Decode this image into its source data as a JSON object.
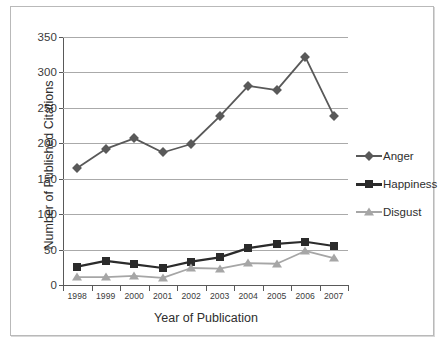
{
  "chart_data": {
    "type": "line",
    "title": "",
    "xlabel": "Year of Publication",
    "ylabel": "Number of Published Citations",
    "categories": [
      "1998",
      "1999",
      "2000",
      "2001",
      "2002",
      "2003",
      "2004",
      "2005",
      "2006",
      "2007"
    ],
    "x": [
      1998,
      1999,
      2000,
      2001,
      2002,
      2003,
      2004,
      2005,
      2006,
      2007
    ],
    "ylim": [
      0,
      350
    ],
    "yticks": [
      0,
      50,
      100,
      150,
      200,
      250,
      300,
      350
    ],
    "ytick_labels": [
      "0",
      "50",
      "100",
      "150",
      "200",
      "250",
      "300",
      "350"
    ],
    "grid": "horizontal",
    "legend_position": "right",
    "series": [
      {
        "name": "Anger",
        "marker": "diamond",
        "color": "#595959",
        "values": [
          165,
          192,
          207,
          187,
          199,
          238,
          281,
          275,
          322,
          239
        ]
      },
      {
        "name": "Happiness",
        "marker": "square",
        "color": "#2b2b2b",
        "values": [
          26,
          34,
          29,
          24,
          33,
          39,
          52,
          58,
          61,
          55
        ]
      },
      {
        "name": "Disgust",
        "marker": "triangle",
        "color": "#a6a6a6",
        "values": [
          11,
          11,
          13,
          10,
          24,
          23,
          31,
          30,
          48,
          38
        ]
      }
    ]
  },
  "colors": {
    "anger": "#595959",
    "happiness": "#2b2b2b",
    "disgust": "#a6a6a6",
    "gridline": "#aaaaaa",
    "axis": "#595959",
    "text": "#2e2e2e",
    "frame": "#b9b9b9",
    "background": "#ffffff"
  }
}
